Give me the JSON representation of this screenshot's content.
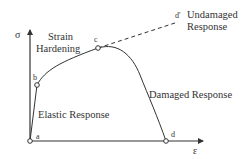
{
  "diagram": {
    "axes": {
      "y_label": "σ",
      "x_label": "ε"
    },
    "points": {
      "a": "a",
      "b": "b",
      "c": "c",
      "d": "d",
      "d_prime": "d'"
    },
    "annotations": {
      "strain_hardening_line1": "Strain",
      "strain_hardening_line2": "Hardening",
      "undamaged_line1": "Undamaged",
      "undamaged_line2": "Response",
      "damaged": "Damaged Response",
      "elastic": "Elastic Response"
    },
    "colors": {
      "line": "#333333",
      "background": "#ffffff"
    }
  }
}
